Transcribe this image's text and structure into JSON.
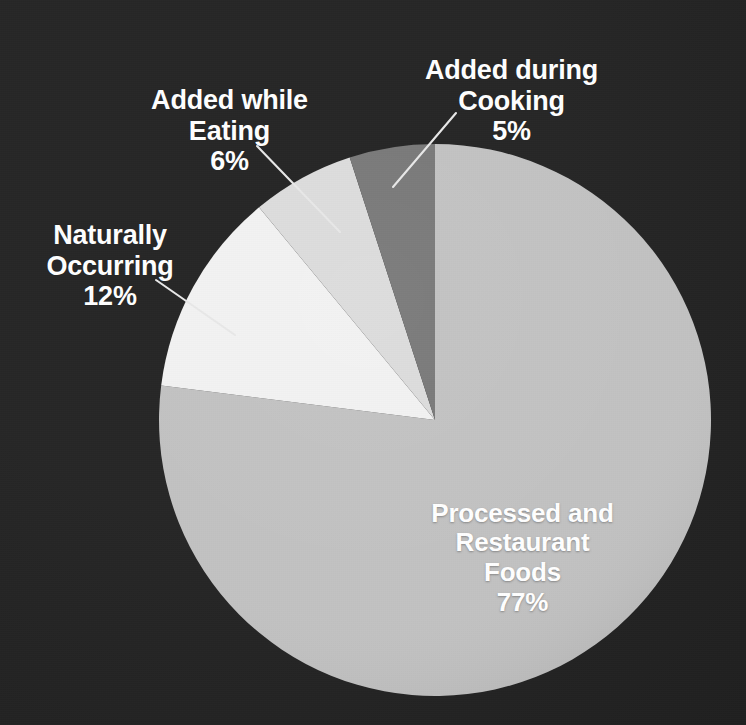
{
  "figure": {
    "background_color": "#272727",
    "label_color": "#ffffff",
    "leader_line_color": "#e8e8e8"
  },
  "chart_data": {
    "type": "pie",
    "title": "",
    "subtitle": "",
    "xlabel": "",
    "ylabel": "",
    "grid": false,
    "legend_position": "none",
    "labels_position": "callout",
    "start_angle_deg": 0,
    "direction": "clockwise",
    "units": "percent",
    "total": 100,
    "categories": [
      "Processed and Restaurant Foods",
      "Naturally Occurring",
      "Added while Eating",
      "Added during Cooking"
    ],
    "values": [
      77,
      12,
      6,
      5
    ],
    "value_labels": [
      "77%",
      "12%",
      "6%",
      "5%"
    ],
    "colors": [
      "#c2c2c2",
      "#f2f2f2",
      "#dcdcdc",
      "#787878"
    ],
    "slices": [
      {
        "name": "Processed and Restaurant Foods",
        "label_lines": "Processed and\nRestaurant\nFoods",
        "value": 77,
        "value_label": "77%",
        "color": "#c2c2c2",
        "label_inside": true
      },
      {
        "name": "Naturally Occurring",
        "label_lines": "Naturally\nOccurring",
        "value": 12,
        "value_label": "12%",
        "color": "#f2f2f2",
        "label_inside": false
      },
      {
        "name": "Added while Eating",
        "label_lines": "Added while\nEating",
        "value": 6,
        "value_label": "6%",
        "color": "#dcdcdc",
        "label_inside": false
      },
      {
        "name": "Added during Cooking",
        "label_lines": "Added during\nCooking",
        "value": 5,
        "value_label": "5%",
        "color": "#787878",
        "label_inside": false
      }
    ]
  }
}
